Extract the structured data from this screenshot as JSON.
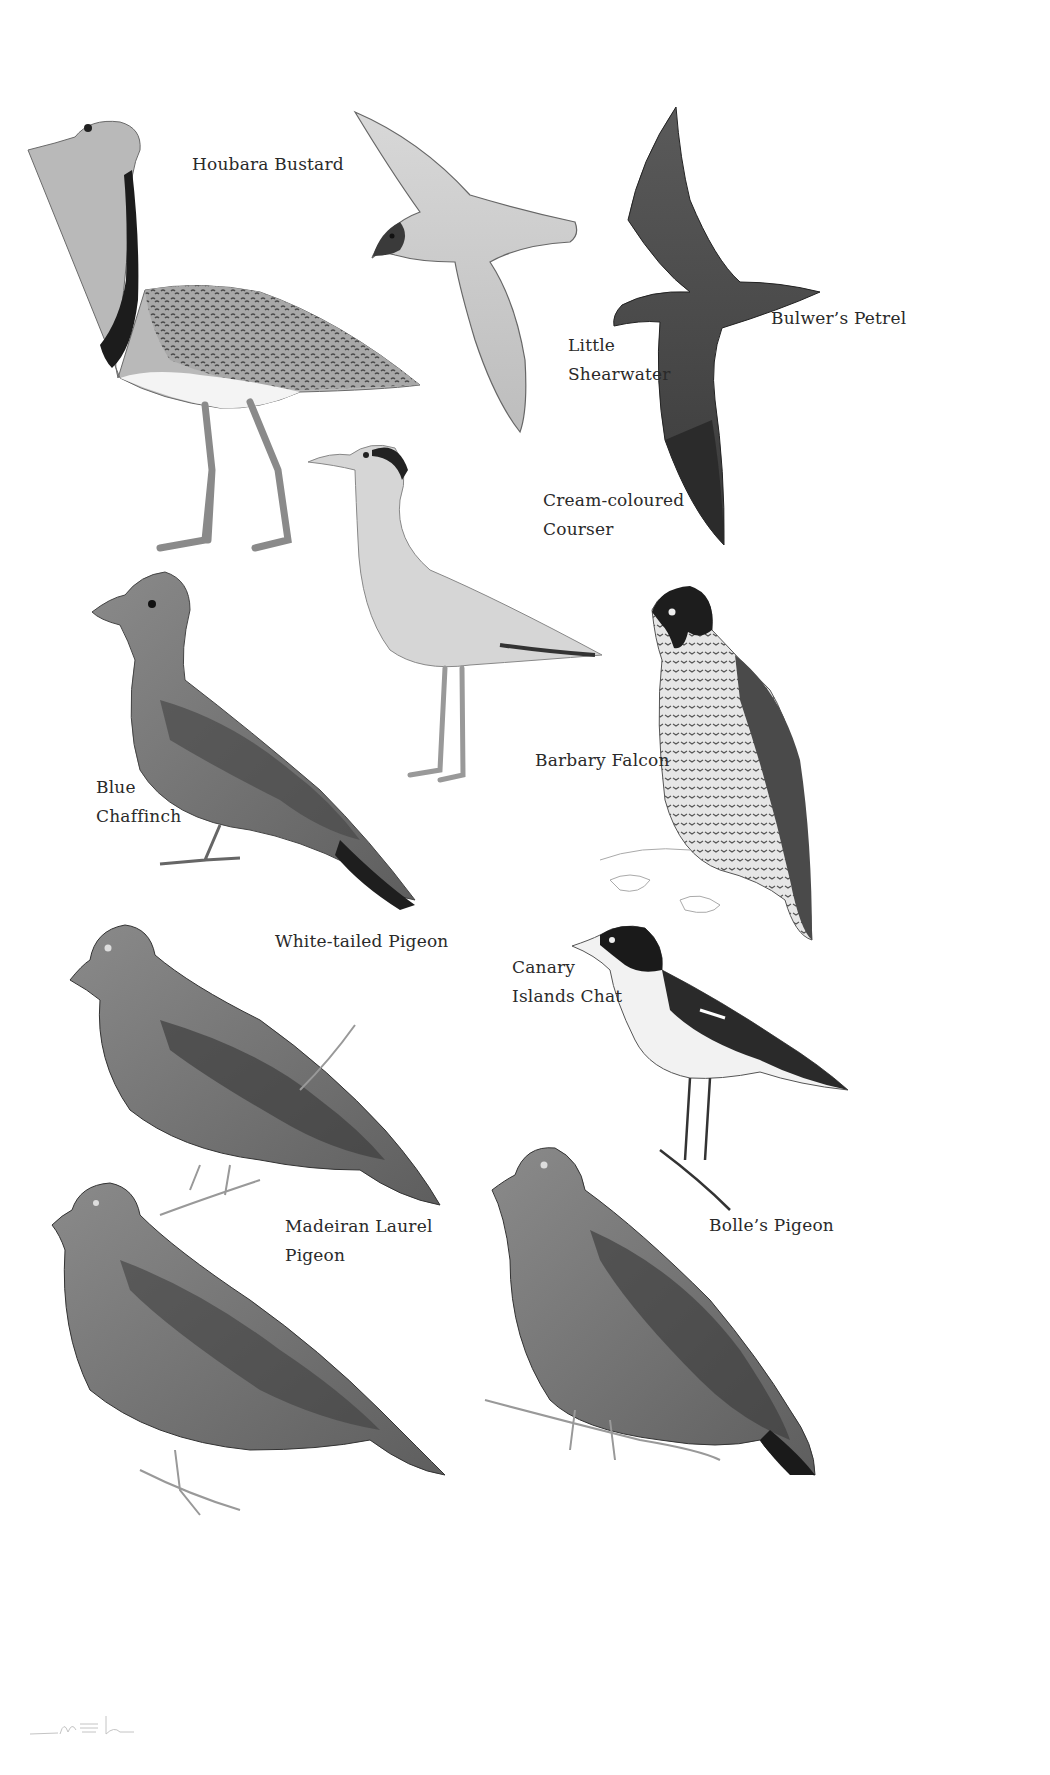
{
  "plate": {
    "background": "#ffffff",
    "label_color": "#2a2a2a",
    "birds": [
      {
        "id": "houbara-bustard",
        "label_lines": [
          "Houbara Bustard"
        ]
      },
      {
        "id": "little-shearwater",
        "label_lines": [
          "Little",
          "Shearwater"
        ]
      },
      {
        "id": "bulwers-petrel",
        "label_lines": [
          "Bulwer’s Petrel"
        ]
      },
      {
        "id": "cream-coloured-courser",
        "label_lines": [
          "Cream-coloured",
          "Courser"
        ]
      },
      {
        "id": "blue-chaffinch",
        "label_lines": [
          "Blue",
          "Chaffinch"
        ]
      },
      {
        "id": "barbary-falcon",
        "label_lines": [
          "Barbary Falcon"
        ]
      },
      {
        "id": "white-tailed-pigeon",
        "label_lines": [
          "White-tailed Pigeon"
        ]
      },
      {
        "id": "canary-islands-chat",
        "label_lines": [
          "Canary",
          "Islands Chat"
        ]
      },
      {
        "id": "madeiran-laurel-pigeon",
        "label_lines": [
          "Madeiran Laurel",
          "Pigeon"
        ]
      },
      {
        "id": "bolles-pigeon",
        "label_lines": [
          "Bolle’s Pigeon"
        ]
      }
    ]
  }
}
